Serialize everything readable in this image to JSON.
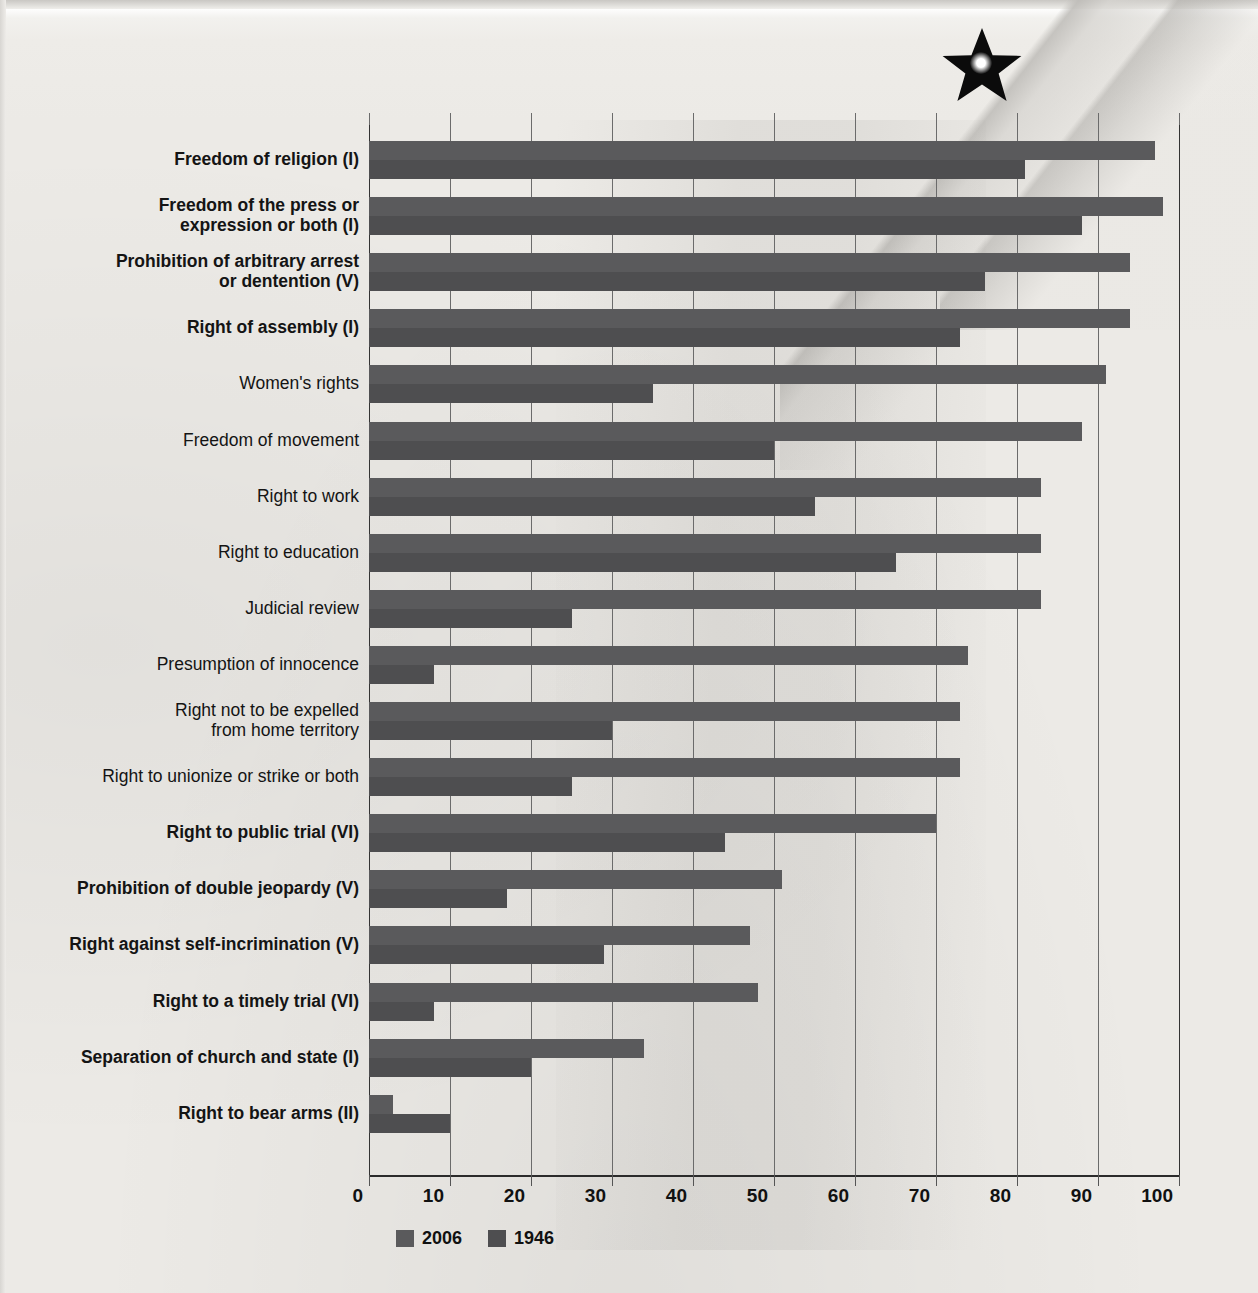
{
  "chart_data": {
    "type": "bar",
    "orientation": "horizontal",
    "title": "",
    "xlabel": "",
    "ylabel": "",
    "xlim": [
      0,
      100
    ],
    "xticks": [
      0,
      10,
      20,
      30,
      40,
      50,
      60,
      70,
      80,
      90,
      100
    ],
    "grid": true,
    "legend_position": "bottom-left",
    "series": [
      {
        "name": "2006",
        "color": "#5a5a5c",
        "values": [
          97,
          98,
          94,
          94,
          91,
          88,
          83,
          83,
          83,
          74,
          73,
          73,
          70,
          51,
          47,
          48,
          34,
          3
        ]
      },
      {
        "name": "1946",
        "color": "#4e4e50",
        "values": [
          81,
          88,
          76,
          73,
          35,
          50,
          55,
          65,
          25,
          8,
          30,
          25,
          44,
          17,
          29,
          8,
          20,
          10
        ]
      }
    ],
    "categories": [
      "Freedom of religion (I)",
      "Freedom of the press or\nexpression or both (I)",
      "Prohibition of arbitrary arrest\nor dentention (V)",
      "Right of assembly (I)",
      "Women's rights",
      "Freedom of movement",
      "Right to work",
      "Right to education",
      "Judicial review",
      "Presumption of innocence",
      "Right not to be expelled\nfrom home territory",
      "Right to unionize or strike or both",
      "Right to public trial (VI)",
      "Prohibition of double jeopardy (V)",
      "Right against self-incrimination (V)",
      "Right to a timely trial (VI)",
      "Separation of church and state (I)",
      "Right to bear arms (II)"
    ],
    "category_emphasis": [
      true,
      true,
      true,
      true,
      false,
      false,
      false,
      false,
      false,
      false,
      false,
      false,
      true,
      true,
      true,
      true,
      true,
      true
    ]
  },
  "legend": {
    "items": [
      {
        "label": "2006",
        "color": "#5a5a5c"
      },
      {
        "label": "1946",
        "color": "#4e4e50"
      }
    ]
  },
  "decoration": {
    "star": "star-icon"
  }
}
